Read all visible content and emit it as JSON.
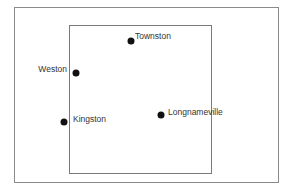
{
  "map": {
    "outer_frame": {
      "x": 14,
      "y": 7,
      "w": 265,
      "h": 176
    },
    "inner_frame": {
      "x": 69,
      "y": 25,
      "w": 143,
      "h": 149
    },
    "places": [
      {
        "name": "Townston",
        "dot": [
          131,
          41
        ],
        "label_pos": [
          135,
          31
        ],
        "anchor": "left"
      },
      {
        "name": "Weston",
        "dot": [
          76,
          73
        ],
        "label_pos": [
          67,
          64
        ],
        "anchor": "right"
      },
      {
        "name": "Kingston",
        "dot": [
          64,
          122
        ],
        "label_pos": [
          73,
          114
        ],
        "anchor": "left"
      },
      {
        "name": "Longnameville",
        "dot": [
          161,
          115
        ],
        "label_pos": [
          168,
          107
        ],
        "anchor": "left"
      }
    ]
  }
}
